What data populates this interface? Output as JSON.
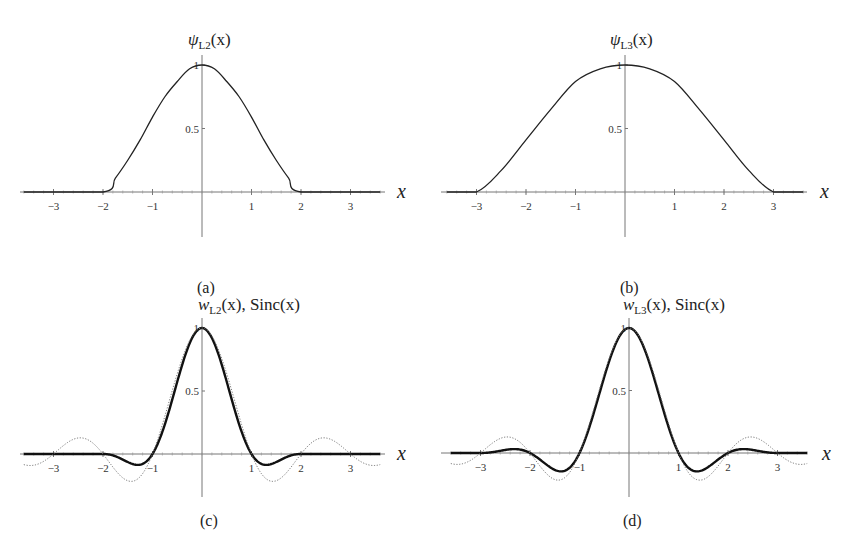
{
  "figure": {
    "panel_labels": [
      "(a)",
      "(b)",
      "(c)",
      "(d)"
    ]
  },
  "chart_data": [
    {
      "panel": "(a)",
      "type": "line",
      "title": "ψL2(x)",
      "title_main": "ψ",
      "title_sub": "L2",
      "title_tail": "(x)",
      "xlabel": "x",
      "ylabel": "",
      "xlim": [
        -3.7,
        3.7
      ],
      "ylim": [
        -0.35,
        1.08
      ],
      "xticks": [
        -3,
        -2,
        -1,
        1,
        2,
        3
      ],
      "xtick_labels": [
        "−3",
        "−2",
        "−1",
        "1",
        "2",
        "3"
      ],
      "yticks": [
        0.5,
        1
      ],
      "ytick_labels": [
        "0.5",
        "1"
      ],
      "grid": false,
      "legend": null,
      "series": [
        {
          "name": "ψL2(x)",
          "style": "solid-thin",
          "x": [
            -3.6,
            -2,
            -1.75,
            -1.5,
            -1.25,
            -1,
            -0.75,
            -0.5,
            -0.25,
            0,
            0.25,
            0.5,
            0.75,
            1,
            1.25,
            1.5,
            1.75,
            2,
            3.6
          ],
          "y": [
            0,
            0,
            0.11,
            0.25,
            0.41,
            0.59,
            0.75,
            0.87,
            0.97,
            1,
            0.97,
            0.87,
            0.75,
            0.59,
            0.41,
            0.25,
            0.11,
            0,
            0
          ]
        }
      ]
    },
    {
      "panel": "(b)",
      "type": "line",
      "title": "ψL3(x)",
      "title_main": "ψ",
      "title_sub": "L3",
      "title_tail": "(x)",
      "xlabel": "x",
      "ylabel": "",
      "xlim": [
        -3.7,
        3.7
      ],
      "ylim": [
        -0.35,
        1.08
      ],
      "xticks": [
        -3,
        -2,
        -1,
        1,
        2,
        3
      ],
      "xtick_labels": [
        "−3",
        "−2",
        "−1",
        "1",
        "2",
        "3"
      ],
      "yticks": [
        0.5,
        1
      ],
      "ytick_labels": [
        "0.5",
        "1"
      ],
      "grid": false,
      "legend": null,
      "series": [
        {
          "name": "ψL3(x)",
          "style": "solid-thin",
          "x": [
            -3.6,
            -3,
            -2.5,
            -2,
            -1.5,
            -1,
            -0.5,
            0,
            0.5,
            1,
            1.5,
            2,
            2.5,
            3,
            3.6
          ],
          "y": [
            0,
            0,
            0.17,
            0.41,
            0.65,
            0.87,
            0.97,
            1,
            0.97,
            0.87,
            0.65,
            0.41,
            0.17,
            0,
            0
          ]
        }
      ]
    },
    {
      "panel": "(c)",
      "type": "line",
      "title": "wL2(x), Sinc(x)",
      "title_main": "w",
      "title_sub": "L2",
      "title_tail": "(x), Sinc(x)",
      "xlabel": "x",
      "ylabel": "",
      "xlim": [
        -3.7,
        3.7
      ],
      "ylim": [
        -0.35,
        1.08
      ],
      "xticks": [
        -3,
        -2,
        -1,
        1,
        2,
        3
      ],
      "xtick_labels": [
        "−3",
        "−2",
        "−1",
        "1",
        "2",
        "3"
      ],
      "yticks": [
        0.5,
        1
      ],
      "ytick_labels": [
        "0.5",
        "1"
      ],
      "grid": false,
      "legend": null,
      "series": [
        {
          "name": "wL2(x)",
          "style": "solid-thick",
          "formula": "lanczos",
          "a": 2,
          "x_range": [
            -3.6,
            3.6
          ]
        },
        {
          "name": "Sinc(x)",
          "style": "dotted",
          "formula": "sinc",
          "x_range": [
            -3.6,
            3.6
          ]
        }
      ]
    },
    {
      "panel": "(d)",
      "type": "line",
      "title": "wL3(x), Sinc(x)",
      "title_main": "w",
      "title_sub": "L3",
      "title_tail": "(x), Sinc(x)",
      "xlabel": "x",
      "ylabel": "",
      "xlim": [
        -3.7,
        3.7
      ],
      "ylim": [
        -0.35,
        1.08
      ],
      "xticks": [
        -3,
        -2,
        -1,
        1,
        2,
        3
      ],
      "xtick_labels": [
        "−3",
        "−2",
        "−1",
        "1",
        "2",
        "3"
      ],
      "yticks": [
        0.5,
        1
      ],
      "ytick_labels": [
        "0.5",
        "1"
      ],
      "grid": false,
      "legend": null,
      "series": [
        {
          "name": "wL3(x)",
          "style": "solid-thick",
          "formula": "lanczos",
          "a": 3,
          "x_range": [
            -3.6,
            3.6
          ]
        },
        {
          "name": "Sinc(x)",
          "style": "dotted",
          "formula": "sinc",
          "x_range": [
            -3.6,
            3.6
          ]
        }
      ]
    }
  ]
}
